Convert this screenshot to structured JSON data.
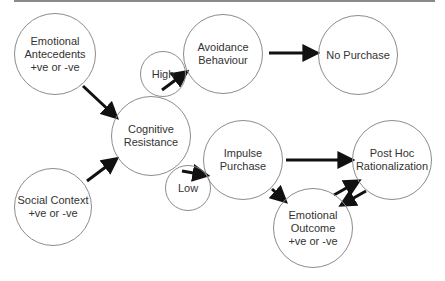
{
  "diagram": {
    "type": "flow",
    "nodes": [
      {
        "id": "emotional_antecedents",
        "label": "Emotional\nAntecedents\n+ve  or -ve",
        "cx": 55,
        "cy": 54,
        "r": 41
      },
      {
        "id": "high",
        "label": "High",
        "cx": 163,
        "cy": 74,
        "r": 23
      },
      {
        "id": "avoidance_behaviour",
        "label": "Avoidance\nBehaviour",
        "cx": 223,
        "cy": 54,
        "r": 40
      },
      {
        "id": "no_purchase",
        "label": "No Purchase",
        "cx": 358,
        "cy": 55,
        "r": 40
      },
      {
        "id": "cognitive_resistance",
        "label": "Cognitive\nResistance",
        "cx": 151,
        "cy": 136,
        "r": 40
      },
      {
        "id": "social_context",
        "label": "Social Context\n+ve or -ve",
        "cx": 53,
        "cy": 207,
        "r": 39
      },
      {
        "id": "low",
        "label": "Low",
        "cx": 188,
        "cy": 188,
        "r": 23
      },
      {
        "id": "impulse_purchase",
        "label": "Impulse\nPurchase",
        "cx": 243,
        "cy": 160,
        "r": 40
      },
      {
        "id": "post_hoc_rationalization",
        "label": "Post Hoc\nRationalization",
        "cx": 392,
        "cy": 160,
        "r": 40
      },
      {
        "id": "emotional_outcome",
        "label": "Emotional\nOutcome\n+ve  or -ve",
        "cx": 313,
        "cy": 228,
        "r": 40
      }
    ],
    "edges": [
      {
        "from": "emotional_antecedents",
        "to": "cognitive_resistance",
        "x1": 83,
        "y1": 86,
        "x2": 115,
        "y2": 116
      },
      {
        "from": "social_context",
        "to": "cognitive_resistance",
        "x1": 87,
        "y1": 181,
        "x2": 115,
        "y2": 160
      },
      {
        "from": "high",
        "to": "avoidance_behaviour",
        "x1": 162,
        "y1": 90,
        "x2": 185,
        "y2": 73
      },
      {
        "from": "avoidance_behaviour",
        "to": "no_purchase",
        "x1": 269,
        "y1": 53,
        "x2": 315,
        "y2": 53
      },
      {
        "from": "low",
        "to": "impulse_purchase",
        "x1": 182,
        "y1": 171,
        "x2": 205,
        "y2": 175
      },
      {
        "from": "impulse_purchase",
        "to": "post_hoc_rationalization",
        "x1": 286,
        "y1": 160,
        "x2": 350,
        "y2": 160
      },
      {
        "from": "impulse_purchase",
        "to": "emotional_outcome",
        "x1": 272,
        "y1": 189,
        "x2": 284,
        "y2": 200
      },
      {
        "from": "emotional_outcome",
        "to": "post_hoc_rationalization",
        "x1": 334,
        "y1": 195,
        "x2": 357,
        "y2": 182
      },
      {
        "from": "post_hoc_rationalization",
        "to": "emotional_outcome",
        "x1": 366,
        "y1": 191,
        "x2": 343,
        "y2": 204
      }
    ],
    "colors": {
      "stroke": "#8c8c8c",
      "arrow": "#111111",
      "text": "#333333",
      "rule": "#8a8a8a"
    }
  }
}
